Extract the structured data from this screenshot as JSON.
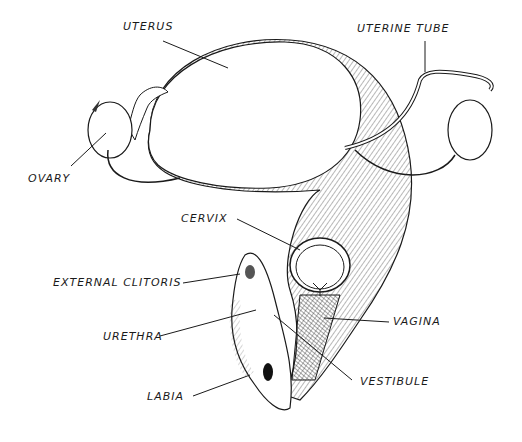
{
  "diagram": {
    "type": "anatomical-illustration",
    "style": "pen-and-ink hatched drawing, black on white",
    "labels": [
      {
        "id": "uterus",
        "text": "UTERUS"
      },
      {
        "id": "uterine-tube",
        "text": "UTERINE TUBE"
      },
      {
        "id": "ovary",
        "text": "OVARY"
      },
      {
        "id": "cervix",
        "text": "CERVIX"
      },
      {
        "id": "external-clitoris",
        "text": "EXTERNAL CLITORIS"
      },
      {
        "id": "urethra",
        "text": "URETHRA"
      },
      {
        "id": "vagina",
        "text": "VAGINA"
      },
      {
        "id": "labia",
        "text": "LABIA"
      },
      {
        "id": "vestibule",
        "text": "VESTIBULE"
      }
    ],
    "colors": {
      "ink": "#1a1a1a",
      "background": "#ffffff"
    }
  }
}
